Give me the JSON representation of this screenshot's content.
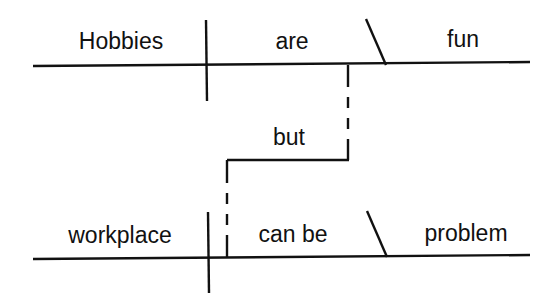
{
  "diagram": {
    "kind": "reed-kellogg-sentence-diagram",
    "sentence": "Hobbies are fun but workplace can be problem",
    "ink_color": "#111111",
    "background_color": "#ffffff",
    "clauses": [
      {
        "id": "clause-top",
        "subject": "Hobbies",
        "verb": "are",
        "predicate_adjective": "fun"
      },
      {
        "id": "clause-bottom",
        "subject": "workplace",
        "verb": "can be",
        "predicate_adjective": "problem"
      }
    ],
    "conjunction": {
      "id": "conjunction-but",
      "label": "but",
      "line_style": "dashed"
    },
    "labels": {
      "top_subject": "Hobbies",
      "top_verb": "are",
      "top_complement": "fun",
      "conjunction": "but",
      "bottom_subject": "workplace",
      "bottom_verb": "can be",
      "bottom_complement": "problem"
    }
  }
}
